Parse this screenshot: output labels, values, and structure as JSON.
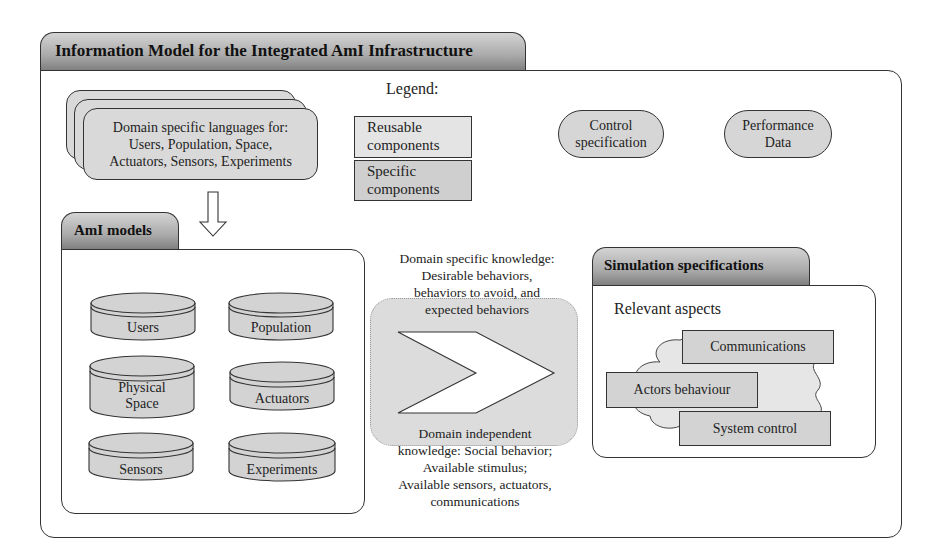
{
  "diagram": {
    "title": "Information Model for the Integrated AmI Infrastructure",
    "dsl_box": {
      "lines": [
        "Domain specific languages for:",
        "Users, Population, Space,",
        "Actuators, Sensors, Experiments"
      ]
    },
    "legend": {
      "heading": "Legend:",
      "reusable": [
        "Reusable",
        "components"
      ],
      "specific": [
        "Specific",
        "components"
      ],
      "reusable_color": "#e4e4e4",
      "specific_color": "#cfcfcf"
    },
    "outputs": {
      "control": [
        "Control",
        "specification"
      ],
      "performance": [
        "Performance",
        "Data"
      ]
    },
    "aml_models": {
      "tab_label": "AmI models",
      "cylinders": [
        {
          "label": [
            "Users"
          ]
        },
        {
          "label": [
            "Population"
          ]
        },
        {
          "label": [
            "Physical",
            "Space"
          ]
        },
        {
          "label": [
            "Actuators"
          ]
        },
        {
          "label": [
            "Sensors"
          ]
        },
        {
          "label": [
            "Experiments"
          ]
        }
      ]
    },
    "knowledge": {
      "specific": [
        "Domain specific knowledge:",
        "Desirable behaviors,",
        "behaviors to avoid, and",
        "expected behaviors"
      ],
      "independent": [
        "Domain independent",
        "knowledge: Social behavior;",
        "Available stimulus;",
        "Available sensors, actuators,",
        "communications"
      ]
    },
    "simulation": {
      "tab_label": "Simulation specifications",
      "subtitle": "Relevant aspects",
      "aspects": [
        "Communications",
        "Actors behaviour",
        "System control"
      ]
    },
    "colors": {
      "component_fill": "#d3d3d3",
      "tab_gradient_top": "#d4d4d4",
      "tab_gradient_bottom": "#7d7d7d",
      "outline": "#333333"
    }
  }
}
